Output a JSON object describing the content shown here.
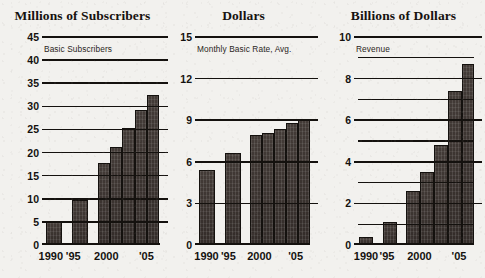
{
  "chart_data": [
    {
      "type": "bar",
      "title": "Millions of Subscribers",
      "series_label": "Basic Subscribers",
      "xlabel": "",
      "ylabel": "Millions of Subscribers",
      "ylim": [
        0,
        45
      ],
      "yticks": [
        0,
        5,
        10,
        15,
        20,
        25,
        30,
        35,
        40,
        45
      ],
      "minor_gridlines": [],
      "grid": true,
      "legend": "none",
      "xtick_labels": [
        "1990",
        "'95",
        "2000",
        "'05"
      ],
      "xtick_values": [
        1990,
        1995,
        2000,
        2005
      ],
      "categories": [
        1990,
        1995,
        1998,
        1999,
        2000,
        2001,
        2002,
        2003,
        2004,
        2005,
        2006
      ],
      "values": [
        5.0,
        9.7,
        17.8,
        21.2,
        25.4,
        29.3,
        32.5,
        35.0,
        35.0,
        35.0,
        35.0
      ]
    },
    {
      "type": "bar",
      "title": "Dollars",
      "series_label": "Monthly Basic Rate, Avg.",
      "xlabel": "",
      "ylabel": "Dollars",
      "ylim": [
        0,
        15
      ],
      "yticks": [
        0,
        3,
        6,
        9,
        12,
        15
      ],
      "minor_gridlines": [],
      "grid": true,
      "legend": "none",
      "xtick_labels": [
        "1990",
        "'95",
        "2000",
        "'05"
      ],
      "xtick_values": [
        1990,
        1995,
        2000,
        2005
      ],
      "categories": [
        1990,
        1995,
        1998,
        1999,
        2000,
        2001,
        2002,
        2003,
        2006
      ],
      "values": [
        5.4,
        6.6,
        7.9,
        8.1,
        8.4,
        8.8,
        9.1,
        10.7,
        10.7
      ]
    },
    {
      "type": "bar",
      "title": "Billions of Dollars",
      "series_label": "Revenue",
      "xlabel": "",
      "ylabel": "Billions of Dollars",
      "ylim": [
        0,
        10
      ],
      "yticks": [
        0,
        2,
        4,
        6,
        8,
        10
      ],
      "minor_gridlines": [
        1,
        3,
        5,
        7,
        9
      ],
      "grid": true,
      "legend": "none",
      "xtick_labels": [
        "1990",
        "'95",
        "2000",
        "'05"
      ],
      "xtick_values": [
        1990,
        1995,
        2000,
        2005
      ],
      "categories": [
        1990,
        1995,
        2000,
        2001,
        2002,
        2003,
        2004,
        2005
      ],
      "values": [
        0.4,
        1.1,
        2.6,
        3.5,
        4.8,
        7.4,
        8.7,
        8.7
      ]
    }
  ],
  "panels": [
    {
      "title": "Millions of Subscribers",
      "series_label": "Basic Subscribers",
      "yticks": [
        "45",
        "40",
        "35",
        "30",
        "25",
        "20",
        "15",
        "10",
        "5",
        "0"
      ],
      "xlabels": [
        "1990",
        "'95",
        "2000",
        "'05"
      ]
    },
    {
      "title": "Dollars",
      "series_label": "Monthly Basic Rate, Avg.",
      "yticks": [
        "15",
        "12",
        "9",
        "6",
        "3",
        "0"
      ],
      "xlabels": [
        "1990",
        "'95",
        "2000",
        "'05"
      ]
    },
    {
      "title": "Billions of Dollars",
      "series_label": "Revenue",
      "yticks": [
        "10",
        "8",
        "6",
        "4",
        "2",
        "0"
      ],
      "xlabels": [
        "1990",
        "'95",
        "2000",
        "'05"
      ]
    }
  ],
  "colors": {
    "bar": "#3a3330",
    "axis": "#14110e",
    "background": "#f2f1ee",
    "title": "#16120f"
  }
}
